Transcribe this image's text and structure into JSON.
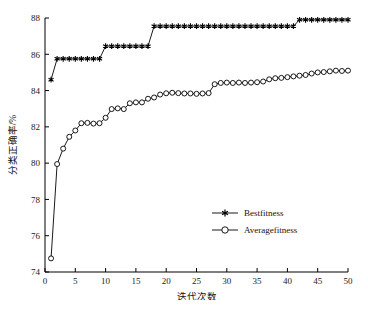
{
  "chart_data": {
    "type": "line",
    "title": "",
    "xlabel": "迭代次数",
    "ylabel": "分类正确率/%",
    "xlim": [
      0,
      50
    ],
    "ylim": [
      74,
      88
    ],
    "xticks": [
      0,
      5,
      10,
      15,
      20,
      25,
      30,
      35,
      40,
      45,
      50
    ],
    "yticks": [
      74,
      76,
      78,
      80,
      82,
      84,
      86,
      88
    ],
    "grid": false,
    "legend_position": "lower-right",
    "x": [
      1,
      2,
      3,
      4,
      5,
      6,
      7,
      8,
      9,
      10,
      11,
      12,
      13,
      14,
      15,
      16,
      17,
      18,
      19,
      20,
      21,
      22,
      23,
      24,
      25,
      26,
      27,
      28,
      29,
      30,
      31,
      32,
      33,
      34,
      35,
      36,
      37,
      38,
      39,
      40,
      41,
      42,
      43,
      44,
      45,
      46,
      47,
      48,
      49,
      50
    ],
    "series": [
      {
        "name": "Bestfitness",
        "marker": "star",
        "color": "#000000",
        "values": [
          84.6,
          85.75,
          85.75,
          85.75,
          85.75,
          85.75,
          85.75,
          85.75,
          85.75,
          86.45,
          86.45,
          86.45,
          86.45,
          86.45,
          86.45,
          86.45,
          86.45,
          87.55,
          87.55,
          87.55,
          87.55,
          87.55,
          87.55,
          87.55,
          87.55,
          87.55,
          87.55,
          87.55,
          87.55,
          87.55,
          87.55,
          87.55,
          87.55,
          87.55,
          87.55,
          87.55,
          87.55,
          87.55,
          87.55,
          87.55,
          87.55,
          87.9,
          87.9,
          87.9,
          87.9,
          87.9,
          87.9,
          87.9,
          87.9,
          87.9
        ]
      },
      {
        "name": "Averagefitness",
        "marker": "circle",
        "color": "#000000",
        "values": [
          74.75,
          79.95,
          80.8,
          81.45,
          81.8,
          82.2,
          82.22,
          82.18,
          82.2,
          82.5,
          82.98,
          83.02,
          82.98,
          83.3,
          83.35,
          83.35,
          83.55,
          83.62,
          83.78,
          83.85,
          83.88,
          83.86,
          83.84,
          83.84,
          83.82,
          83.84,
          83.86,
          84.35,
          84.42,
          84.44,
          84.42,
          84.44,
          84.42,
          84.44,
          84.46,
          84.5,
          84.62,
          84.68,
          84.7,
          84.74,
          84.78,
          84.82,
          84.86,
          84.94,
          85.0,
          85.02,
          85.06,
          85.1,
          85.08,
          85.1
        ]
      }
    ]
  },
  "legend": {
    "entries": [
      {
        "label": "Bestfitness"
      },
      {
        "label": "Averagefitness"
      }
    ]
  },
  "caption": {
    "text": ""
  }
}
